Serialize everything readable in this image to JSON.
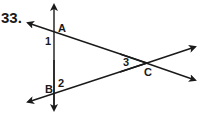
{
  "problem": {
    "number": "33."
  },
  "figure": {
    "points": {
      "A": "A",
      "B": "B",
      "C": "C"
    },
    "angles": {
      "angle1": "1",
      "angle2": "2",
      "angle3": "3"
    },
    "line_color": "#1a1a1a"
  }
}
